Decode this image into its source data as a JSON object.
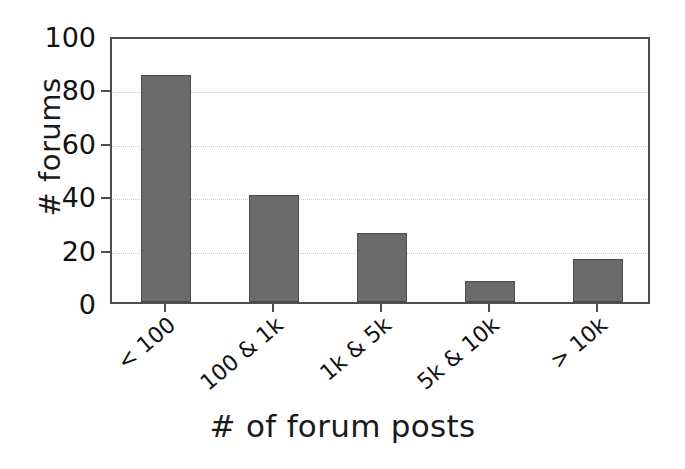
{
  "chart_data": {
    "type": "bar",
    "title": "",
    "xlabel": "# of forum posts",
    "ylabel": "# forums",
    "categories": [
      "< 100",
      "100 & 1k",
      "1k & 5k",
      "5k & 10k",
      "> 10k"
    ],
    "values": [
      85,
      40,
      26,
      8,
      16
    ],
    "series": [
      {
        "name": "# forums",
        "values": [
          85,
          40,
          26,
          8,
          16
        ]
      }
    ],
    "ylim": [
      0,
      100
    ],
    "yticks": [
      0,
      20,
      40,
      60,
      80,
      100
    ],
    "ytick_labels": [
      "0",
      "20",
      "40",
      "60",
      "80",
      "100"
    ],
    "xtick_labels": [
      "< 100",
      "100 & 1k",
      "1k & 5k",
      "5k & 10k",
      "> 10k"
    ],
    "xtick_rotation": -40,
    "grid": true,
    "grid_axis": "y",
    "grid_style": "dotted",
    "legend": false,
    "legend_position": "none",
    "bar_color": "#6b6b6b",
    "bar_edge_color": "#4a4a4a",
    "grid_color": "#cccccc",
    "axis_color": "#4e4e4e",
    "text_color": "#111111",
    "background_color": "#ffffff"
  }
}
